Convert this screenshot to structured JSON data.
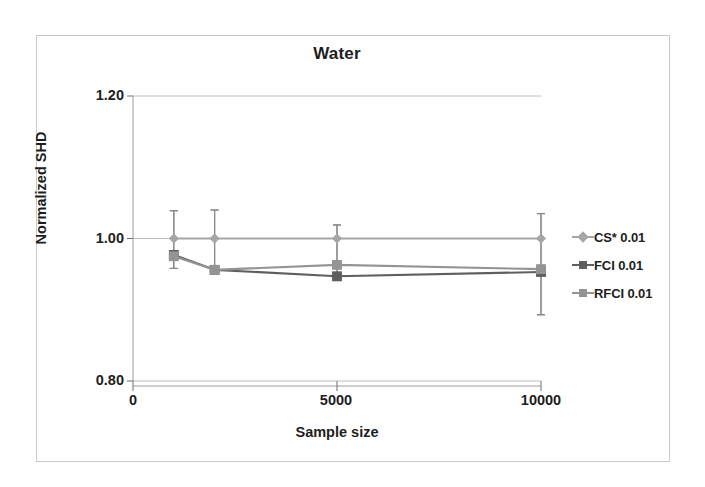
{
  "figure": {
    "title": "Water",
    "xlabel": "Sample size",
    "ylabel": "Normalized SHD"
  },
  "axes": {
    "y_ticks": [
      "1.20",
      "1.00",
      "0.80"
    ],
    "x_ticks": [
      "0",
      "5000",
      "10000"
    ]
  },
  "legend": {
    "position": "right",
    "items": [
      {
        "label": "CS* 0.01",
        "marker": "diamond",
        "color": "#a6a6a6"
      },
      {
        "label": "FCI 0.01",
        "marker": "square",
        "color": "#5f5f5f"
      },
      {
        "label": "RFCI 0.01",
        "marker": "square",
        "color": "#949494"
      }
    ]
  },
  "chart_data": {
    "type": "line",
    "title": "Water",
    "xlabel": "Sample size",
    "ylabel": "Normalized SHD",
    "xlim": [
      0,
      10000
    ],
    "ylim": [
      0.8,
      1.2
    ],
    "yticks": [
      0.8,
      1.0,
      1.2
    ],
    "xticks": [
      0,
      5000,
      10000
    ],
    "grid": true,
    "legend_position": "right",
    "x": [
      1000,
      2000,
      5000,
      10000
    ],
    "series": [
      {
        "name": "CS* 0.01",
        "color": "#a6a6a6",
        "marker": "diamond",
        "values": [
          1.0,
          1.0,
          1.0,
          1.0
        ],
        "error_low": [
          1.0,
          1.0,
          1.0,
          1.0
        ],
        "error_high": [
          1.0,
          1.0,
          1.0,
          1.0
        ]
      },
      {
        "name": "FCI 0.01",
        "color": "#5f5f5f",
        "marker": "square",
        "values": [
          0.977,
          0.956,
          0.947,
          0.953
        ],
        "error_low": [
          0.958,
          0.953,
          0.941,
          0.893
        ],
        "error_high": [
          1.039,
          1.04,
          1.019,
          1.035
        ]
      },
      {
        "name": "RFCI 0.01",
        "color": "#949494",
        "marker": "square",
        "values": [
          0.975,
          0.956,
          0.963,
          0.957
        ],
        "error_low": [
          0.958,
          0.953,
          0.941,
          0.893
        ],
        "error_high": [
          1.039,
          1.04,
          1.019,
          1.035
        ]
      }
    ]
  }
}
